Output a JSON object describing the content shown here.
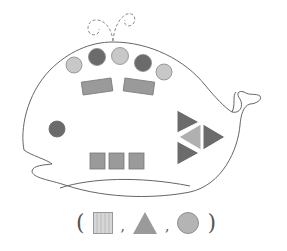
{
  "figure": {
    "colors": {
      "outline": "#666666",
      "dark_gray": "#6b6b6b",
      "medium_gray": "#9a9a9a",
      "light_gray": "#c8c8c8",
      "background": "#ffffff"
    },
    "shapes": {
      "circles": [
        {
          "shade": "light",
          "cx": 74,
          "cy": 65
        },
        {
          "shade": "dark",
          "cx": 97,
          "cy": 57
        },
        {
          "shade": "light",
          "cx": 120,
          "cy": 56
        },
        {
          "shade": "dark",
          "cx": 143,
          "cy": 63
        },
        {
          "shade": "light",
          "cx": 164,
          "cy": 72
        },
        {
          "shade": "dark",
          "cx": 57,
          "cy": 129,
          "label": "eye"
        }
      ],
      "rectangles": [
        {
          "shade": "medium",
          "label": "left-brow"
        },
        {
          "shade": "medium",
          "label": "right-brow"
        }
      ],
      "squares": [
        {
          "shade": "medium"
        },
        {
          "shade": "medium"
        },
        {
          "shade": "medium"
        }
      ],
      "triangles": [
        {
          "shade": "dark",
          "position": "top"
        },
        {
          "shade": "light",
          "position": "middle-left"
        },
        {
          "shade": "dark",
          "position": "middle-right"
        },
        {
          "shade": "dark",
          "position": "bottom"
        }
      ]
    },
    "answer_choices": {
      "open_paren": "(",
      "close_paren": ")",
      "separator": ",",
      "items": [
        "square",
        "triangle",
        "circle"
      ]
    }
  }
}
